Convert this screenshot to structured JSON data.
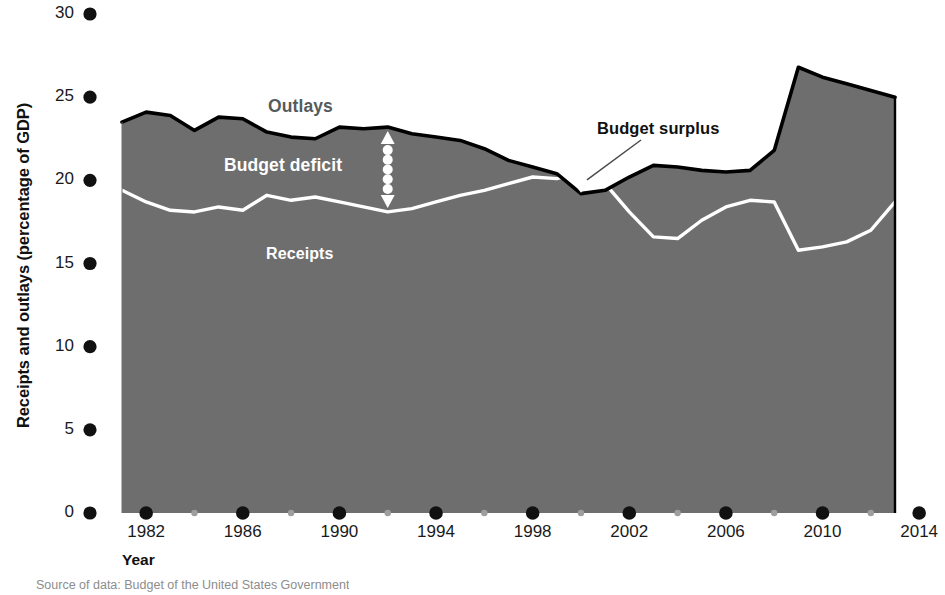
{
  "chart_data": {
    "type": "area",
    "title": "",
    "xlabel": "Year",
    "ylabel": "Receipts and outlays (percentage of GDP)",
    "xlim": [
      1981,
      2014
    ],
    "ylim": [
      0,
      30
    ],
    "grid": false,
    "legend_position": "inline-annotations",
    "x_tick_labels": [
      "1982",
      "1986",
      "1990",
      "1994",
      "1998",
      "2002",
      "2006",
      "2010",
      "2014"
    ],
    "x_tick_values": [
      1982,
      1986,
      1990,
      1994,
      1998,
      2002,
      2006,
      2010,
      2014
    ],
    "x_minor_tick_values": [
      1984,
      1988,
      1992,
      1996,
      2000,
      2004,
      2008,
      2012
    ],
    "y_tick_labels": [
      "0",
      "5",
      "10",
      "15",
      "20",
      "25",
      "30"
    ],
    "y_tick_values": [
      0,
      5,
      10,
      15,
      20,
      25,
      30
    ],
    "x": [
      1981,
      1982,
      1983,
      1984,
      1985,
      1986,
      1987,
      1988,
      1989,
      1990,
      1991,
      1992,
      1993,
      1994,
      1995,
      1996,
      1997,
      1998,
      1999,
      2000,
      2001,
      2002,
      2003,
      2004,
      2005,
      2006,
      2007,
      2008,
      2009,
      2010,
      2011,
      2012,
      2013
    ],
    "series": [
      {
        "name": "Outlays",
        "color": "#000000",
        "values": [
          23.5,
          24.1,
          23.9,
          23.0,
          23.8,
          23.7,
          22.9,
          22.6,
          22.5,
          23.2,
          23.1,
          23.2,
          22.8,
          22.6,
          22.4,
          21.9,
          21.2,
          20.8,
          20.4,
          19.2,
          19.4,
          20.2,
          20.9,
          20.8,
          20.6,
          20.5,
          20.6,
          21.8,
          26.8,
          26.2,
          25.8,
          25.4,
          25.0
        ]
      },
      {
        "name": "Receipts",
        "color": "#ffffff",
        "values": [
          19.4,
          18.7,
          18.2,
          18.1,
          18.4,
          18.2,
          19.1,
          18.8,
          19.0,
          18.7,
          18.4,
          18.1,
          18.3,
          18.7,
          19.1,
          19.4,
          19.8,
          20.2,
          20.1,
          20.5,
          19.8,
          18.1,
          16.6,
          16.5,
          17.6,
          18.4,
          18.8,
          18.7,
          15.8,
          16.0,
          16.3,
          17.0,
          18.7
        ]
      }
    ],
    "annotations": [
      {
        "name": "outlays",
        "text": "Outlays"
      },
      {
        "name": "budget-deficit",
        "text": "Budget deficit"
      },
      {
        "name": "receipts",
        "text": "Receipts"
      },
      {
        "name": "budget-surplus",
        "text": "Budget surplus"
      }
    ],
    "fill_color": "#6e6e6e",
    "background_color": "#ffffff"
  },
  "axes": {
    "y_title": "Receipts and outlays (percentage of GDP)",
    "x_title": "Year"
  },
  "labels": {
    "outlays": "Outlays",
    "budget_deficit": "Budget deficit",
    "receipts": "Receipts",
    "budget_surplus": "Budget surplus"
  },
  "source": {
    "note": "Source of data: Budget of the United States Government"
  }
}
